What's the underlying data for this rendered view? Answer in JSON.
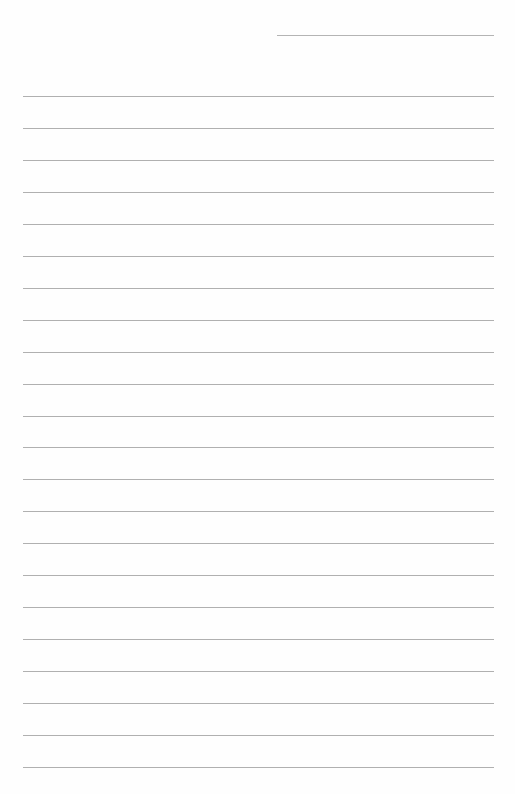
{
  "page": {
    "type": "lined-writing-paper",
    "background_color": "#fefefe",
    "line_color": "#b0b0b0",
    "header_line": {
      "present": true
    },
    "rule_count": 22,
    "rules": []
  }
}
